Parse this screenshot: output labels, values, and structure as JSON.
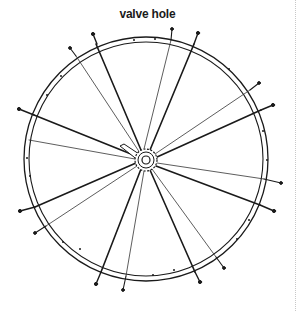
{
  "diagram": {
    "title": "valve hole",
    "colors": {
      "line": "#1a1a1a",
      "thin_spoke": "#333333",
      "divider": "#c8c8c8",
      "background": "#ffffff"
    },
    "wheel": {
      "center": [
        146,
        159
      ],
      "rim_outer_radius": 122,
      "rim_inner_radius": 117,
      "hub_flange_radius": 11,
      "axle_radius": 4
    },
    "spokes": [
      {
        "nipple": [
          93,
          35
        ],
        "weight": "thick"
      },
      {
        "nipple": [
          70,
          48
        ],
        "weight": "thin"
      },
      {
        "nipple": [
          172,
          29
        ],
        "weight": "thin"
      },
      {
        "nipple": [
          198,
          34
        ],
        "weight": "thick"
      },
      {
        "nipple": [
          259,
          83
        ],
        "weight": "thin"
      },
      {
        "nipple": [
          272,
          105
        ],
        "weight": "thick"
      },
      {
        "nipple": [
          280,
          183
        ],
        "weight": "thin"
      },
      {
        "nipple": [
          273,
          210
        ],
        "weight": "thick"
      },
      {
        "nipple": [
          223,
          268
        ],
        "weight": "thin"
      },
      {
        "nipple": [
          199,
          281
        ],
        "weight": "thick"
      },
      {
        "nipple": [
          123,
          290
        ],
        "weight": "thin"
      },
      {
        "nipple": [
          96,
          283
        ],
        "weight": "thick"
      },
      {
        "nipple": [
          35,
          233
        ],
        "weight": "thin"
      },
      {
        "nipple": [
          21,
          211
        ],
        "weight": "thick"
      },
      {
        "nipple": [
          28,
          140
        ],
        "weight": "thin"
      },
      {
        "nipple": [
          20,
          110
        ],
        "weight": "thick"
      }
    ]
  }
}
